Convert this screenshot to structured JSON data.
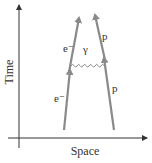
{
  "diagram": {
    "type": "feynman-diagram",
    "axes": {
      "y_label": "Time",
      "x_label": "Space"
    },
    "particles": {
      "electron_incoming": "e⁻",
      "electron_outgoing": "e⁻",
      "proton_incoming": "p",
      "proton_outgoing": "p",
      "photon": "γ"
    },
    "colors": {
      "axis": "#333333",
      "worldline": "#8a8a8a",
      "photon": "#8a8a8a",
      "text": "#333333"
    }
  }
}
